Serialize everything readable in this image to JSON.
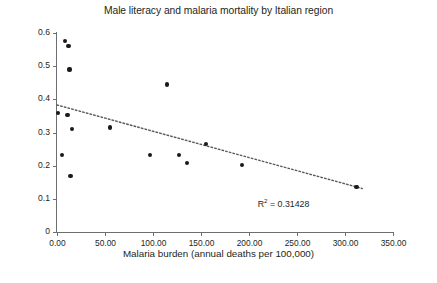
{
  "chart_data": {
    "type": "scatter",
    "title": "Male literacy and malaria mortality by Italian region",
    "xlabel": "Malaria burden (annual deaths per 100,000)",
    "ylabel": "Male literacy rate",
    "xlim": [
      0,
      350
    ],
    "ylim": [
      0,
      0.6
    ],
    "grid": false,
    "legend": null,
    "x_tick_labels": [
      "0.00",
      "50.00",
      "100.00",
      "150.00",
      "200.00",
      "250.00",
      "300.00",
      "350.00"
    ],
    "x_tick_values": [
      0,
      50,
      100,
      150,
      200,
      250,
      300,
      350
    ],
    "y_tick_labels": [
      "0",
      "0.1",
      "0.2",
      "0.3",
      "0.4",
      "0.5",
      "0.6"
    ],
    "y_tick_values": [
      0,
      0.1,
      0.2,
      0.3,
      0.4,
      0.5,
      0.6
    ],
    "points": [
      {
        "x": 8,
        "y": 0.575
      },
      {
        "x": 12,
        "y": 0.562
      },
      {
        "x": 13,
        "y": 0.49
      },
      {
        "x": 1,
        "y": 0.36
      },
      {
        "x": 11,
        "y": 0.352
      },
      {
        "x": 16,
        "y": 0.311
      },
      {
        "x": 5,
        "y": 0.232
      },
      {
        "x": 14,
        "y": 0.17
      },
      {
        "x": 55,
        "y": 0.315
      },
      {
        "x": 97,
        "y": 0.232
      },
      {
        "x": 115,
        "y": 0.445
      },
      {
        "x": 127,
        "y": 0.233
      },
      {
        "x": 135,
        "y": 0.208
      },
      {
        "x": 155,
        "y": 0.265
      },
      {
        "x": 193,
        "y": 0.201
      },
      {
        "x": 312,
        "y": 0.136
      }
    ],
    "trendline": {
      "type": "linear",
      "style": "dotted",
      "x_start": 0,
      "y_start": 0.383,
      "x_end": 318,
      "y_end": 0.131
    },
    "annotations": [
      {
        "name": "r2",
        "text_prefix": "R",
        "text_sup": "2",
        "text_suffix": " = 0.31428",
        "x": 236,
        "y": 0.088
      }
    ]
  }
}
